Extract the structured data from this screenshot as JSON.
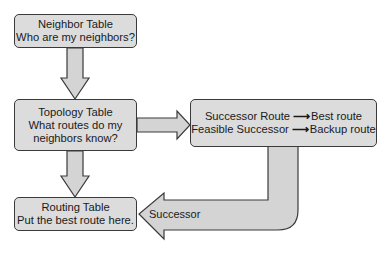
{
  "nodes": {
    "neighbor_table": {
      "title": "Neighbor Table",
      "subtitle": "Who are my neighbors?"
    },
    "topology_table": {
      "title": "Topology Table",
      "line2": "What routes do my",
      "line3": "neighbors know?"
    },
    "successor_box": {
      "row1_left": "Successor Route",
      "row1_right": "Best route",
      "row2_left": "Feasible Successor",
      "row2_right": "Backup route",
      "arrow_glyph": "⟶"
    },
    "routing_table": {
      "title": "Routing Table",
      "subtitle": "Put the best route here."
    }
  },
  "edges": [
    {
      "from": "neighbor_table",
      "to": "topology_table",
      "label": ""
    },
    {
      "from": "topology_table",
      "to": "successor_box",
      "label": ""
    },
    {
      "from": "topology_table",
      "to": "routing_table",
      "label": ""
    },
    {
      "from": "successor_box",
      "to": "routing_table",
      "label": "Successor"
    }
  ],
  "labels": {
    "successor_arrow": "Successor"
  },
  "colors": {
    "box_fill": "#dcdcdc",
    "arrow_fill": "#d4d4d4",
    "stroke": "#3a3a3a"
  }
}
